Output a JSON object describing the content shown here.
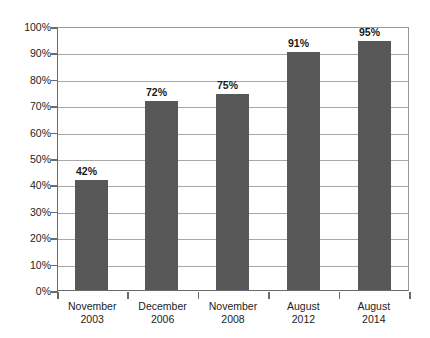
{
  "chart_data": {
    "type": "bar",
    "title": "",
    "subtitle": "",
    "xlabel": "",
    "ylabel": "",
    "categories": [
      "November 2003",
      "December 2006",
      "November 2008",
      "August 2012",
      "August 2014"
    ],
    "category_lines": [
      {
        "line1": "November",
        "line2": "2003"
      },
      {
        "line1": "December",
        "line2": "2006"
      },
      {
        "line1": "November",
        "line2": "2008"
      },
      {
        "line1": "August",
        "line2": "2012"
      },
      {
        "line1": "August",
        "line2": "2014"
      }
    ],
    "values": [
      42,
      72,
      75,
      91,
      95
    ],
    "data_labels": [
      "42%",
      "72%",
      "75%",
      "91%",
      "95%"
    ],
    "ylim": [
      0,
      100
    ],
    "ytick_values": [
      0,
      10,
      20,
      30,
      40,
      50,
      60,
      70,
      80,
      90,
      100
    ],
    "ytick_labels": [
      "100%",
      "90%",
      "80%",
      "70%",
      "60%",
      "50%",
      "40%",
      "30%",
      "20%",
      "10%",
      "0%"
    ],
    "grid": true,
    "legend": false,
    "legend_position": "none",
    "bar_color": "#585858",
    "gridline_color": "#a8a8a8",
    "axis_color": "#6b6b6b",
    "background_color": "#ffffff",
    "text_color": "#222222"
  }
}
